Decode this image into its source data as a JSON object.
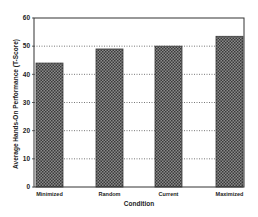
{
  "chart_data": {
    "type": "bar",
    "title": "",
    "xlabel": "Condition",
    "ylabel": "Average Hands-On Performance (T-Score)",
    "categories": [
      "Minimized",
      "Random",
      "Current",
      "Maximized"
    ],
    "values": [
      44,
      49,
      50,
      53.5
    ],
    "ylim": [
      0,
      60
    ],
    "yticks": [
      0,
      10,
      20,
      30,
      40,
      50,
      60
    ],
    "grid": {
      "y": true,
      "style": "dotted"
    },
    "legend": null,
    "bar_fill": "crosshatch",
    "colors": {
      "bar": "#6a6a6a",
      "bar_dark": "#3a3a3a",
      "axis": "#333333",
      "grid": "#555555"
    }
  }
}
